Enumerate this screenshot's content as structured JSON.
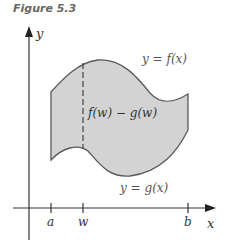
{
  "figure": {
    "title": "Figure 5.3",
    "axes": {
      "x_label": "x",
      "y_label": "y",
      "ticks": [
        {
          "label": "a"
        },
        {
          "label": "w"
        },
        {
          "label": "b"
        }
      ]
    },
    "curves": {
      "upper_label": "y = f(x)",
      "lower_label": "y = g(x)"
    },
    "segment_label": "f(w) − g(w)",
    "colors": {
      "fill": "#d3d3d3",
      "stroke": "#555555",
      "axis": "#333333"
    }
  }
}
